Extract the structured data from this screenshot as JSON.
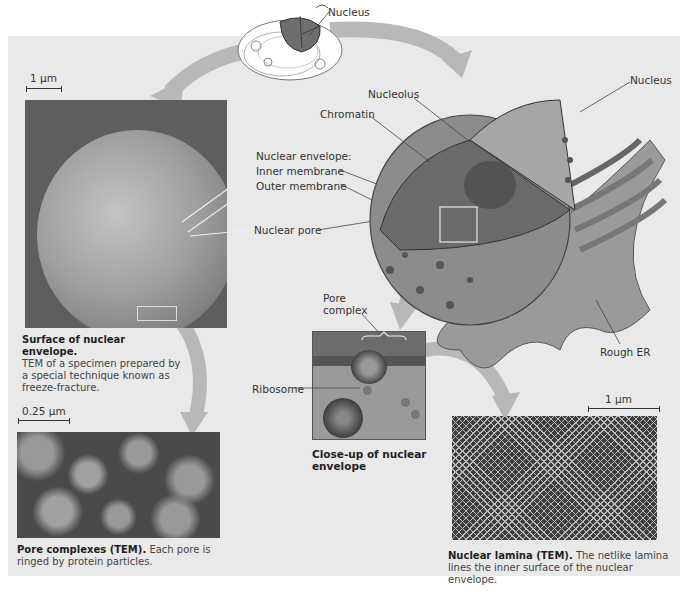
{
  "figure": {
    "top_label": "Nucleus",
    "scale_bars": {
      "surface": "1 µm",
      "pores": "0.25 µm",
      "lamina": "1 µm"
    },
    "labels": {
      "nucleolus": "Nucleolus",
      "chromatin": "Chromatin",
      "nucleus_right": "Nucleus",
      "nuclear_envelope": "Nuclear envelope:",
      "inner_membrane": "Inner membrane",
      "outer_membrane": "Outer membrane",
      "nuclear_pore": "Nuclear pore",
      "pore_complex": "Pore complex",
      "ribosome": "Ribosome",
      "rough_er": "Rough ER"
    },
    "captions": {
      "surface_title": "Surface of nuclear envelope.",
      "surface_body": "TEM of a specimen prepared by a special technique known as freeze-fracture.",
      "pore_title": "Pore complexes (TEM).",
      "pore_body": "Each pore is ringed by protein particles.",
      "closeup_title": "Close-up of nuclear envelope",
      "lamina_title": "Nuclear lamina (TEM).",
      "lamina_body": "The netlike lamina lines the inner surface of the nuclear envelope."
    },
    "colors": {
      "panel_bg": "#e9e9e9",
      "arrow": "#b8b8b8",
      "nucleus_fill": "#8a8a8a",
      "micrograph_dark": "#5a5a5a"
    }
  }
}
